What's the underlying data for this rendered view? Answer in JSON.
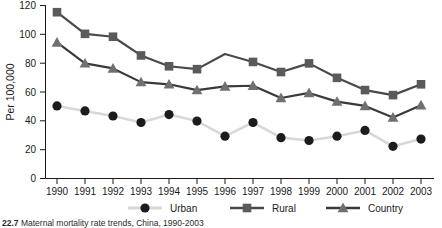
{
  "chart_data": {
    "type": "line",
    "title": "",
    "xlabel": "",
    "ylabel": "Per 100,000",
    "categories": [
      "1990",
      "1991",
      "1992",
      "1993",
      "1994",
      "1995",
      "1996",
      "1997",
      "1998",
      "1999",
      "2000",
      "2001",
      "2002",
      "2003"
    ],
    "x": [
      1990,
      1991,
      1992,
      1993,
      1994,
      1995,
      1996,
      1997,
      1998,
      1999,
      2000,
      2001,
      2002,
      2003
    ],
    "ylim": [
      0,
      120
    ],
    "xlim": [
      1990,
      2003
    ],
    "yticks": [
      0,
      20,
      40,
      60,
      80,
      100,
      120
    ],
    "ytick_labels": [
      "0",
      "20",
      "40",
      "60",
      "80",
      "100",
      "120"
    ],
    "grid": false,
    "legend_position": "bottom",
    "series": [
      {
        "name": "Urban",
        "marker": "circle",
        "marker_color": "#1c1c1c",
        "line_color": "#d8d8d8",
        "values": [
          50,
          46.5,
          43,
          38.5,
          44,
          39.5,
          29,
          38.5,
          28,
          26,
          29,
          33,
          22,
          27
        ]
      },
      {
        "name": "Rural",
        "marker": "square",
        "marker_color": "#5a5a5a",
        "line_color": "#4a4a4a",
        "values": [
          115,
          100,
          98,
          85,
          77.5,
          75.5,
          86,
          80.5,
          73.5,
          79.5,
          69.5,
          61,
          57.5,
          65
        ]
      },
      {
        "name": "Country",
        "marker": "triangle",
        "marker_color": "#707070",
        "line_color": "#3a3a3a",
        "values": [
          94,
          79.5,
          76,
          66.5,
          65,
          61,
          63.5,
          64,
          55.5,
          59,
          53,
          50,
          42,
          50.5
        ]
      }
    ]
  },
  "legend": {
    "items": [
      {
        "label": "Urban"
      },
      {
        "label": "Rural"
      },
      {
        "label": "Country"
      }
    ]
  },
  "axis": {
    "ylabel": "Per 100,000"
  },
  "caption": {
    "number": "22.7",
    "text": "Maternal mortality rate trends, China, 1990-2003"
  }
}
